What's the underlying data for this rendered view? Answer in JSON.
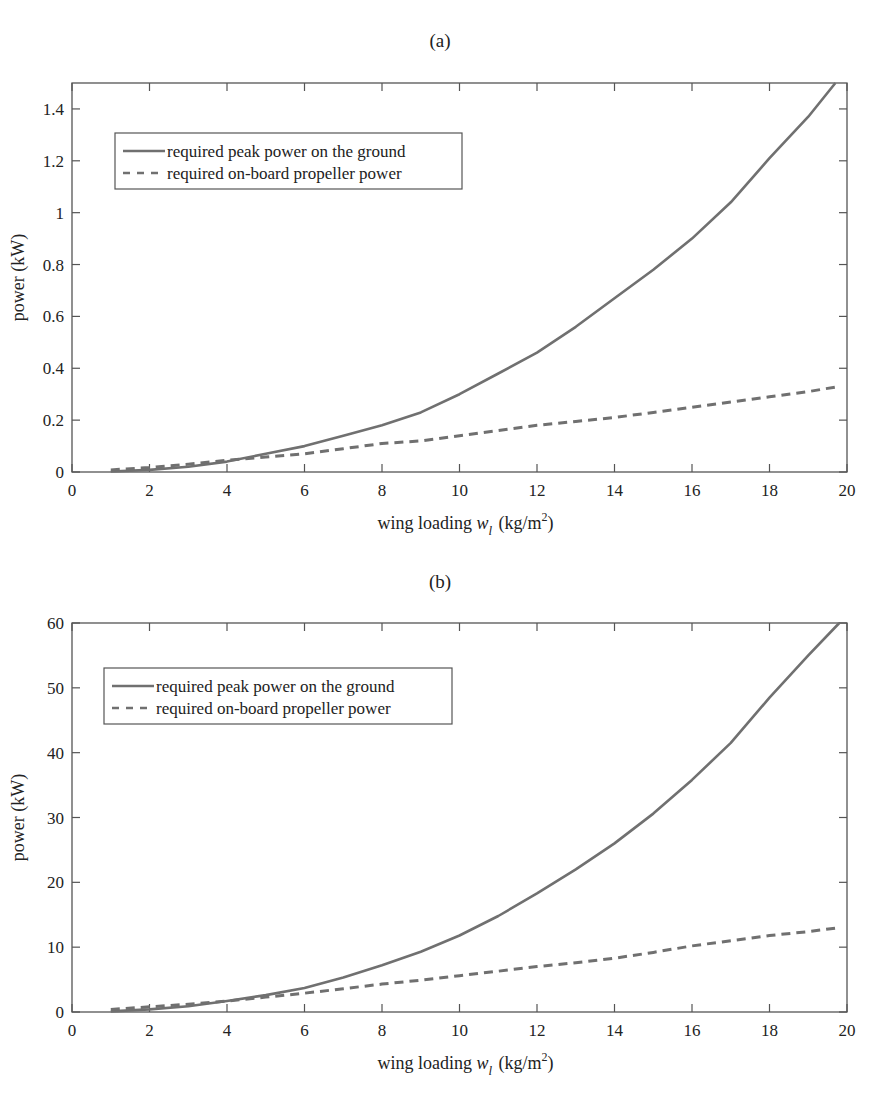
{
  "figure": {
    "panels": [
      {
        "label": "(a)"
      },
      {
        "label": "(b)"
      }
    ]
  },
  "chart_data": [
    {
      "type": "line",
      "title": "(a)",
      "xlabel": "wing loading  w_l (kg/m^2)",
      "xlabel_parts": {
        "main": "wing loading",
        "var": "w",
        "sub": "l",
        "unit_open": "(kg/m",
        "sup": "2",
        "unit_close": ")"
      },
      "ylabel": "power (kW)",
      "xlim": [
        0,
        20
      ],
      "ylim": [
        0,
        1.5
      ],
      "xticks": [
        0,
        2,
        4,
        6,
        8,
        10,
        12,
        14,
        16,
        18,
        20
      ],
      "yticks": [
        0,
        0.2,
        0.4,
        0.6,
        0.8,
        1,
        1.2,
        1.4
      ],
      "ytick_labels": [
        "0",
        "0.2",
        "0.4",
        "0.6",
        "0.8",
        "1",
        "1.2",
        "1.4"
      ],
      "grid": false,
      "legend_position": "upper left",
      "x": [
        1,
        2,
        3,
        4,
        5,
        6,
        7,
        8,
        9,
        10,
        11,
        12,
        13,
        14,
        15,
        16,
        17,
        18,
        19,
        19.7
      ],
      "series": [
        {
          "name": "required peak power on the ground",
          "style": "solid",
          "values": [
            0.002,
            0.008,
            0.02,
            0.04,
            0.07,
            0.1,
            0.14,
            0.18,
            0.23,
            0.3,
            0.38,
            0.46,
            0.56,
            0.67,
            0.78,
            0.9,
            1.04,
            1.21,
            1.37,
            1.5
          ]
        },
        {
          "name": "required on-board propeller power",
          "style": "dashed",
          "values": [
            0.008,
            0.017,
            0.03,
            0.045,
            0.058,
            0.07,
            0.09,
            0.11,
            0.12,
            0.14,
            0.16,
            0.18,
            0.195,
            0.21,
            0.23,
            0.25,
            0.27,
            0.29,
            0.31,
            0.33
          ]
        }
      ],
      "x_dashed_end": 19.8
    },
    {
      "type": "line",
      "title": "(b)",
      "xlabel": "wing loading  w_l (kg/m^2)",
      "xlabel_parts": {
        "main": "wing loading",
        "var": "w",
        "sub": "l",
        "unit_open": "(kg/m",
        "sup": "2",
        "unit_close": ")"
      },
      "ylabel": "power (kW)",
      "xlim": [
        0,
        20
      ],
      "ylim": [
        0,
        60
      ],
      "xticks": [
        0,
        2,
        4,
        6,
        8,
        10,
        12,
        14,
        16,
        18,
        20
      ],
      "yticks": [
        0,
        10,
        20,
        30,
        40,
        50,
        60
      ],
      "ytick_labels": [
        "0",
        "10",
        "20",
        "30",
        "40",
        "50",
        "60"
      ],
      "grid": false,
      "legend_position": "upper left",
      "x": [
        1,
        2,
        3,
        4,
        5,
        6,
        7,
        8,
        9,
        10,
        11,
        12,
        13,
        14,
        15,
        16,
        17,
        18,
        19,
        19.8
      ],
      "series": [
        {
          "name": "required peak power on the ground",
          "style": "solid",
          "values": [
            0.1,
            0.4,
            0.9,
            1.7,
            2.6,
            3.7,
            5.3,
            7.2,
            9.3,
            11.8,
            14.8,
            18.3,
            22.0,
            26.0,
            30.6,
            35.8,
            41.5,
            48.5,
            55.0,
            60.0
          ]
        },
        {
          "name": "required on-board propeller power",
          "style": "dashed",
          "values": [
            0.4,
            0.8,
            1.2,
            1.7,
            2.3,
            2.9,
            3.6,
            4.3,
            4.9,
            5.6,
            6.3,
            7.0,
            7.6,
            8.3,
            9.2,
            10.2,
            11.0,
            11.8,
            12.4,
            13.0
          ]
        }
      ],
      "x_dashed_end": 19.8
    }
  ]
}
